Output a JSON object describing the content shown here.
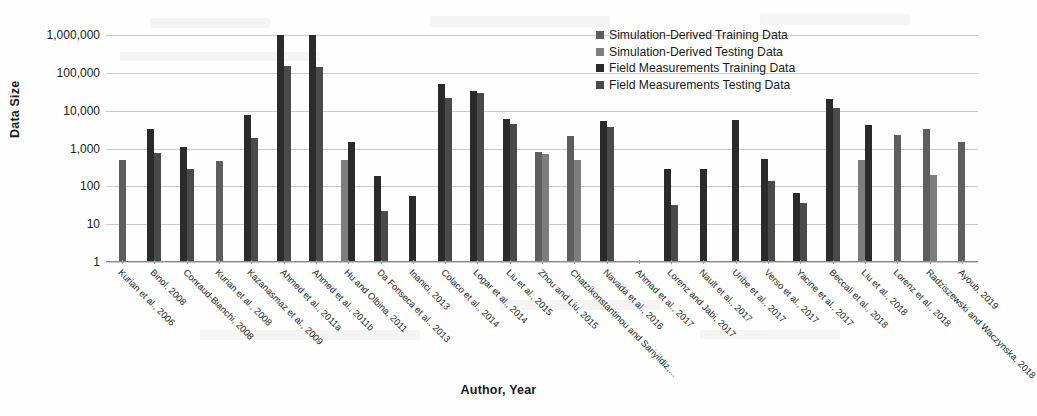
{
  "chart_data": {
    "type": "bar",
    "title": "",
    "xlabel": "Author, Year",
    "ylabel": "Data Size",
    "scale": "log10",
    "ylim": [
      1,
      1000000
    ],
    "yticks": [
      1,
      10,
      100,
      1000,
      10000,
      100000,
      1000000
    ],
    "ytick_labels": [
      "1",
      "10",
      "100",
      "1,000",
      "10,000",
      "100,000",
      "1,000,000"
    ],
    "grid": true,
    "legend_position": "top-right",
    "categories": [
      "Kurian et al., 2006",
      "Binol, 2008",
      "Conraud-Bianchi, 2008",
      "Kurian et al., 2008",
      "Kazanasmaz et al., 2009",
      "Ahmed et al., 2011a",
      "Ahmed et al., 2011b",
      "Hu and Olbina, 2011",
      "Da Fonseca et al., 2013",
      "Inanici, 2013",
      "Colaco et al., 2014",
      "Logar et al., 2014",
      "Liu et al., 2015",
      "Zhou and Liu, 2015",
      "Chatzikonstantinou and Sariyildiz,...",
      "Navada et al., 2016",
      "Ahmad et al., 2017",
      "Lorenz and Jabi, 2017",
      "Nault et al., 2017",
      "Uribe et al., 2017",
      "Verso et al., 2017",
      "Yacine et al., 2017",
      "Beccali et al., 2018",
      "Liu et al., 2018",
      "Lorenz et al., 2018",
      "Radziszewski and Waczynska, 2018",
      "Ayoub, 2019"
    ],
    "series": [
      {
        "name": "Simulation-Derived Training Data",
        "color": "#5e5e5e",
        "values": [
          500,
          null,
          null,
          480,
          null,
          null,
          null,
          null,
          null,
          null,
          null,
          null,
          null,
          800,
          2200,
          null,
          null,
          null,
          null,
          null,
          null,
          null,
          null,
          null,
          2300,
          3300,
          1500
        ]
      },
      {
        "name": "Simulation-Derived Testing Data",
        "color": "#7d7d7d",
        "values": [
          null,
          null,
          null,
          null,
          null,
          null,
          null,
          500,
          null,
          null,
          null,
          null,
          null,
          700,
          500,
          null,
          null,
          null,
          null,
          null,
          null,
          null,
          null,
          500,
          null,
          200,
          null
        ]
      },
      {
        "name": "Field Measurements Training Data",
        "color": "#2b2b2b",
        "values": [
          null,
          3200,
          1100,
          null,
          7900,
          1000000,
          1000000,
          1500,
          190,
          55,
          50000,
          33000,
          6000,
          null,
          null,
          5500,
          null,
          290,
          290,
          5800,
          530,
          68,
          20000,
          4200,
          null,
          null,
          null
        ]
      },
      {
        "name": "Field Measurements Testing Data",
        "color": "#4a4a4a",
        "values": [
          null,
          780,
          290,
          null,
          1950,
          150000,
          140000,
          null,
          22,
          null,
          22000,
          29000,
          4400,
          null,
          null,
          3600,
          null,
          33,
          null,
          null,
          140,
          37,
          12000,
          null,
          null,
          null,
          null
        ]
      }
    ]
  },
  "legend": {
    "items": [
      {
        "label": "Simulation-Derived Training Data",
        "color": "#5e5e5e"
      },
      {
        "label": "Simulation-Derived Testing Data",
        "color": "#7d7d7d"
      },
      {
        "label": "Field Measurements Training Data",
        "color": "#2b2b2b"
      },
      {
        "label": "Field Measurements Testing Data",
        "color": "#4a4a4a"
      }
    ]
  }
}
